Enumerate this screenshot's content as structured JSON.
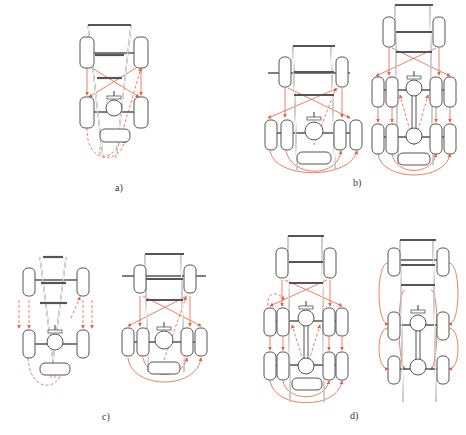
{
  "figure": {
    "width": 466,
    "height": 435,
    "colors": {
      "frame": "#555555",
      "arrow": "#e8603c",
      "spare_accent": "#3b4bd6",
      "label": "#333333"
    },
    "labels": [
      {
        "id": "a",
        "text": "a)",
        "x": 115,
        "y": 182
      },
      {
        "id": "b",
        "text": "b)",
        "x": 353,
        "y": 177
      },
      {
        "id": "c",
        "text": "c)",
        "x": 102,
        "y": 411
      },
      {
        "id": "d",
        "text": "d)",
        "x": 350,
        "y": 410
      }
    ]
  },
  "diagrams": [
    {
      "id": "a",
      "title": "a) 4-wheel truck, tapered frame, spare included",
      "rails": [
        [
          88,
          25,
          103,
          158
        ],
        [
          131,
          25,
          116,
          158
        ]
      ],
      "cross": [
        [
          88,
          25,
          131,
          25
        ],
        [
          95,
          55,
          124,
          55
        ],
        [
          97,
          78,
          122,
          78
        ]
      ],
      "axles": [
        [
          85,
          53,
          147,
          53
        ],
        [
          85,
          112,
          147,
          112
        ]
      ],
      "tires": [
        [
          80,
          37,
          14,
          31
        ],
        [
          134,
          37,
          14,
          31
        ],
        [
          80,
          97,
          14,
          31
        ],
        [
          134,
          97,
          14,
          31
        ]
      ],
      "spare": [
        100,
        129,
        30,
        13
      ],
      "diffs": [
        [
          114,
          108,
          8
        ],
        [
          114,
          97,
          3
        ]
      ],
      "arrows": [
        {
          "d": "M87 68 L87 95",
          "dash": false
        },
        {
          "d": "M141 68 L141 95",
          "dash": false
        },
        {
          "d": "M92 68 L139 97",
          "dash": false
        },
        {
          "d": "M136 68 L89 97",
          "dash": false
        },
        {
          "d": "M87 128 C86 165 120 165 125 140",
          "dash": true
        },
        {
          "d": "M102 142 C94 160 108 160 118 147 L141 68",
          "dash": true
        }
      ]
    },
    {
      "id": "b1",
      "title": "b) 6-wheel truck (dual rear)",
      "rails": [
        [
          293,
          46,
          297,
          170
        ],
        [
          331,
          46,
          335,
          170
        ]
      ],
      "cross": [
        [
          293,
          46,
          335,
          46
        ],
        [
          294,
          72,
          334,
          72
        ],
        [
          294,
          95,
          334,
          95
        ]
      ],
      "axles": [
        [
          268,
          73,
          350,
          73
        ],
        [
          268,
          133,
          350,
          133
        ]
      ],
      "tires": [
        [
          279,
          57,
          12,
          30
        ],
        [
          336,
          57,
          12,
          30
        ],
        [
          265,
          120,
          12,
          30
        ],
        [
          281,
          120,
          12,
          30
        ],
        [
          334,
          120,
          12,
          30
        ],
        [
          350,
          120,
          12,
          30
        ]
      ],
      "spare": [
        297,
        152,
        34,
        12
      ],
      "diffs": [
        [
          314,
          131,
          9
        ],
        [
          314,
          118,
          3
        ]
      ],
      "arrows": [
        {
          "d": "M285 88 L285 117",
          "dash": false
        },
        {
          "d": "M342 88 L342 117",
          "dash": false
        },
        {
          "d": "M288 88 L350 118",
          "dash": false
        },
        {
          "d": "M338 88 L268 118",
          "dash": false
        },
        {
          "d": "M270 151 C275 180 350 180 357 151",
          "dash": false
        },
        {
          "d": "M286 151 C292 178 338 178 341 151",
          "dash": false
        },
        {
          "d": "M314 145 L336 88",
          "dash": true
        }
      ]
    },
    {
      "id": "b2",
      "title": "b) 10-wheel truck (tandem dual rear)",
      "rails": [
        [
          395,
          5,
          398,
          165
        ],
        [
          430,
          5,
          433,
          165
        ]
      ],
      "cross": [
        [
          395,
          5,
          433,
          5
        ],
        [
          396,
          32,
          432,
          32
        ],
        [
          396,
          52,
          432,
          52
        ]
      ],
      "axles": [
        [
          372,
          90,
          454,
          90
        ],
        [
          372,
          137,
          454,
          137
        ]
      ],
      "tires": [
        [
          383,
          17,
          12,
          30
        ],
        [
          433,
          17,
          12,
          30
        ],
        [
          372,
          77,
          12,
          30
        ],
        [
          386,
          77,
          12,
          30
        ],
        [
          430,
          77,
          12,
          30
        ],
        [
          444,
          77,
          12,
          30
        ],
        [
          372,
          124,
          12,
          30
        ],
        [
          386,
          124,
          12,
          30
        ],
        [
          430,
          124,
          12,
          30
        ],
        [
          444,
          124,
          12,
          30
        ]
      ],
      "spare": [
        398,
        153,
        32,
        12
      ],
      "diffs": [
        [
          414,
          88,
          8
        ],
        [
          414,
          77,
          3
        ],
        [
          414,
          136,
          8
        ]
      ],
      "arrows": [
        {
          "d": "M389 48 L389 75",
          "dash": false
        },
        {
          "d": "M439 48 L439 75",
          "dash": false
        },
        {
          "d": "M392 48 L450 76",
          "dash": false
        },
        {
          "d": "M436 48 L376 76",
          "dash": false
        },
        {
          "d": "M378 107 L378 122",
          "dash": false
        },
        {
          "d": "M392 107 L392 122",
          "dash": false
        },
        {
          "d": "M436 107 L436 122",
          "dash": false
        },
        {
          "d": "M450 107 L450 122",
          "dash": false
        },
        {
          "d": "M378 154 C382 182 446 182 450 154",
          "dash": false
        },
        {
          "d": "M392 154 C396 176 432 176 436 154",
          "dash": false
        },
        {
          "d": "M414 145 L400 95",
          "dash": true
        },
        {
          "d": "M414 145 L428 95",
          "dash": true
        }
      ]
    },
    {
      "id": "c1",
      "title": "c) 4-wheel, straight swap",
      "rails": [
        [
          40,
          257,
          55,
          378
        ],
        [
          66,
          257,
          51,
          378
        ]
      ],
      "cross": [
        [
          43,
          257,
          63,
          257
        ],
        [
          41,
          283,
          66,
          283
        ],
        [
          40,
          303,
          67,
          303
        ]
      ],
      "axles": [
        [
          27,
          280,
          85,
          280
        ],
        [
          27,
          344,
          85,
          344
        ]
      ],
      "tires": [
        [
          23,
          268,
          12,
          28
        ],
        [
          77,
          268,
          12,
          28
        ],
        [
          23,
          330,
          12,
          28
        ],
        [
          77,
          330,
          12,
          28
        ]
      ],
      "spare": [
        40,
        363,
        30,
        12
      ],
      "diffs": [
        [
          55,
          342,
          8
        ],
        [
          55,
          331,
          3
        ]
      ],
      "arrows": [
        {
          "d": "M19 300 L19 328",
          "dash": true
        },
        {
          "d": "M29 300 L29 328",
          "dash": true
        },
        {
          "d": "M83 300 L83 328",
          "dash": true
        },
        {
          "d": "M92 300 L92 328",
          "dash": true
        },
        {
          "d": "M28 358 C30 392 58 392 62 370",
          "dash": true
        },
        {
          "d": "M71 318 L80 297",
          "dash": true
        }
      ]
    },
    {
      "id": "c2",
      "title": "c) 6-wheel, dual rear",
      "rails": [
        [
          145,
          254,
          148,
          372
        ],
        [
          181,
          254,
          184,
          372
        ]
      ],
      "cross": [
        [
          145,
          254,
          184,
          254
        ],
        [
          146,
          279,
          183,
          279
        ],
        [
          146,
          300,
          183,
          300
        ]
      ],
      "axles": [
        [
          122,
          276,
          206,
          276
        ],
        [
          122,
          342,
          206,
          342
        ]
      ],
      "tires": [
        [
          134,
          265,
          12,
          28
        ],
        [
          184,
          265,
          12,
          28
        ],
        [
          122,
          328,
          12,
          28
        ],
        [
          137,
          328,
          12,
          28
        ],
        [
          181,
          328,
          12,
          28
        ],
        [
          195,
          328,
          12,
          28
        ]
      ],
      "spare": [
        148,
        362,
        32,
        12
      ],
      "diffs": [
        [
          164,
          340,
          9
        ],
        [
          164,
          328,
          3
        ]
      ],
      "arrows": [
        {
          "d": "M140 296 L140 326",
          "dash": false
        },
        {
          "d": "M190 296 L190 326",
          "dash": false
        },
        {
          "d": "M143 296 L201 326",
          "dash": false
        },
        {
          "d": "M187 296 L128 326",
          "dash": false
        },
        {
          "d": "M128 358 C132 390 197 390 201 358",
          "dash": false
        },
        {
          "d": "M143 358 C148 380 182 380 187 358",
          "dash": false
        },
        {
          "d": "M164 360 L186 297",
          "dash": true
        }
      ]
    },
    {
      "id": "d1",
      "title": "d) 10-wheel, tandem dual rear with spare",
      "rails": [
        [
          288,
          236,
          290,
          402
        ],
        [
          322,
          236,
          324,
          402
        ]
      ],
      "cross": [
        [
          288,
          236,
          324,
          236
        ],
        [
          289,
          262,
          323,
          262
        ],
        [
          289,
          283,
          323,
          283
        ]
      ],
      "axles": [
        [
          264,
          321,
          347,
          321
        ],
        [
          264,
          365,
          347,
          365
        ]
      ],
      "tires": [
        [
          276,
          248,
          12,
          30
        ],
        [
          324,
          248,
          12,
          30
        ],
        [
          264,
          308,
          12,
          28
        ],
        [
          277,
          308,
          12,
          28
        ],
        [
          323,
          308,
          12,
          28
        ],
        [
          336,
          308,
          12,
          28
        ],
        [
          264,
          352,
          12,
          28
        ],
        [
          277,
          352,
          12,
          28
        ],
        [
          323,
          352,
          12,
          28
        ],
        [
          336,
          352,
          12,
          28
        ]
      ],
      "spare": [
        292,
        378,
        30,
        12
      ],
      "diffs": [
        [
          306,
          318,
          8
        ],
        [
          306,
          307,
          3
        ],
        [
          306,
          366,
          8
        ]
      ],
      "arrows": [
        {
          "d": "M282 280 L282 306",
          "dash": false
        },
        {
          "d": "M330 280 L330 306",
          "dash": false
        },
        {
          "d": "M285 280 L342 306",
          "dash": false
        },
        {
          "d": "M327 280 L270 306",
          "dash": false
        },
        {
          "d": "M270 337 L270 350",
          "dash": false
        },
        {
          "d": "M283 337 L283 350",
          "dash": false
        },
        {
          "d": "M329 337 L329 350",
          "dash": false
        },
        {
          "d": "M342 337 L342 350",
          "dash": false
        },
        {
          "d": "M270 381 C275 410 338 410 342 381",
          "dash": false
        },
        {
          "d": "M283 381 C287 402 325 402 329 381",
          "dash": false
        },
        {
          "d": "M306 370 L292 325",
          "dash": true
        },
        {
          "d": "M306 370 L320 325",
          "dash": true
        },
        {
          "d": "M268 306 C266 292 278 290 284 300",
          "dash": true
        }
      ]
    },
    {
      "id": "d2",
      "title": "d) 6-wheel tandem, side loop rotation",
      "rails": [
        [
          400,
          240,
          403,
          402
        ],
        [
          433,
          240,
          436,
          402
        ]
      ],
      "cross": [
        [
          400,
          240,
          436,
          240
        ],
        [
          401,
          265,
          435,
          265
        ],
        [
          401,
          285,
          435,
          285
        ]
      ],
      "axles": [
        [
          388,
          260,
          448,
          260
        ],
        [
          388,
          325,
          448,
          325
        ],
        [
          388,
          369,
          448,
          369
        ]
      ],
      "tires": [
        [
          388,
          248,
          12,
          28
        ],
        [
          437,
          248,
          12,
          28
        ],
        [
          388,
          312,
          12,
          28
        ],
        [
          437,
          312,
          12,
          28
        ],
        [
          388,
          356,
          12,
          28
        ],
        [
          437,
          356,
          12,
          28
        ]
      ],
      "spare": null,
      "diffs": [
        [
          418,
          323,
          8
        ],
        [
          418,
          311,
          3
        ],
        [
          418,
          367,
          8
        ]
      ],
      "arrows": [
        {
          "d": "M388 263 C376 263 376 324 388 324",
          "dash": false
        },
        {
          "d": "M388 328 C376 328 376 369 388 369",
          "dash": false
        },
        {
          "d": "M449 263 C461 263 461 324 449 324",
          "dash": false
        },
        {
          "d": "M449 328 C461 328 461 369 449 369",
          "dash": false
        },
        {
          "d": "M405 290 C397 290 397 360 405 370",
          "dash": false
        },
        {
          "d": "M431 290 C439 290 439 360 431 370",
          "dash": false
        }
      ]
    }
  ]
}
